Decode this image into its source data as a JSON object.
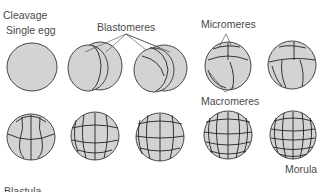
{
  "title": "Cleavage",
  "labels": {
    "cleavage": "Cleavage",
    "single_egg": "Single egg",
    "blastomeres": "Blastomeres",
    "micromeres": "Micromeres",
    "macromeres": "Macromeres",
    "morula": "Morula",
    "blastula": "Blastula"
  },
  "stages": [
    {
      "name": "single-egg",
      "cells": 1
    },
    {
      "name": "2-cell",
      "cells": 2
    },
    {
      "name": "4-cell",
      "cells": 4
    },
    {
      "name": "8-cell",
      "cells": 8
    },
    {
      "name": "16-cell",
      "cells": 16
    },
    {
      "name": "32-cell",
      "cells": 32
    },
    {
      "name": "64-cell-a",
      "cells": 64
    },
    {
      "name": "64-cell-b",
      "cells": 64
    },
    {
      "name": "128-cell",
      "cells": 128
    },
    {
      "name": "morula",
      "cells": 256
    }
  ],
  "colors": {
    "cell_fill": "#d3d3d3",
    "outline": "#333333",
    "text": "#4a4a4a"
  }
}
